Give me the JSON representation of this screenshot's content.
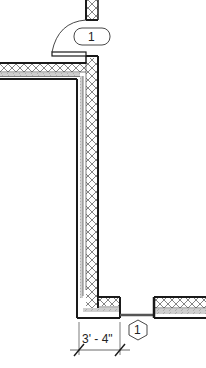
{
  "drawing": {
    "type": "floor-plan-detail",
    "door_tag": {
      "label": "1",
      "shape": "rounded-rect"
    },
    "window_tag": {
      "label": "1",
      "shape": "hexagon"
    },
    "dimension": {
      "label": "3' - 4\""
    }
  },
  "colors": {
    "line": "#1a1a1a",
    "hatch": "#555555",
    "fill_gray": "#bdbdbd"
  }
}
